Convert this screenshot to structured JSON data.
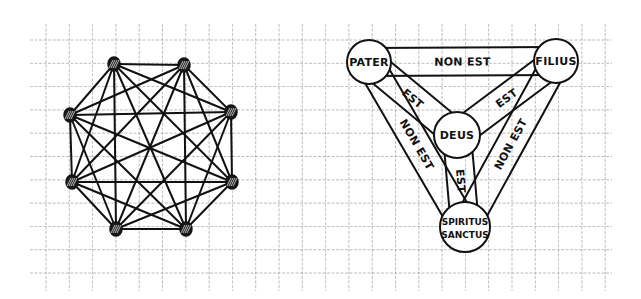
{
  "grid": {
    "x0": 30,
    "y0": 40,
    "pitch": 23.3,
    "cols": 24,
    "rows": 11,
    "x_end": 612,
    "y_end": 285,
    "color": "#9a9a9a"
  },
  "complete_graph": {
    "name": "K8",
    "nodes": [
      {
        "x": 114,
        "y": 64
      },
      {
        "x": 184,
        "y": 65
      },
      {
        "x": 231,
        "y": 112
      },
      {
        "x": 232,
        "y": 182
      },
      {
        "x": 186,
        "y": 229
      },
      {
        "x": 116,
        "y": 229
      },
      {
        "x": 72,
        "y": 182
      },
      {
        "x": 70,
        "y": 115
      }
    ],
    "node_radius": 6
  },
  "trinity": {
    "nodes": {
      "pater": {
        "label": "PATER",
        "x": 369,
        "y": 62,
        "r": 22
      },
      "filius": {
        "label": "FILIUS",
        "x": 556,
        "y": 61,
        "r": 22
      },
      "deus": {
        "label": "DEUS",
        "x": 457,
        "y": 135,
        "r": 23
      },
      "spiritus": {
        "label_line1": "SPIRITUS",
        "label_line2": "SANCTUS",
        "x": 465,
        "y": 227,
        "r": 25
      }
    },
    "edges": [
      {
        "from": "pater",
        "to": "filius",
        "label": "NON EST"
      },
      {
        "from": "pater",
        "to": "deus",
        "label": "EST"
      },
      {
        "from": "filius",
        "to": "deus",
        "label": "EST"
      },
      {
        "from": "deus",
        "to": "spiritus",
        "label": "EST"
      },
      {
        "from": "pater",
        "to": "spiritus",
        "label": "NON EST"
      },
      {
        "from": "filius",
        "to": "spiritus",
        "label": "NON EST"
      }
    ]
  },
  "colors": {
    "ink": "#111111",
    "paper": "#ffffff"
  }
}
